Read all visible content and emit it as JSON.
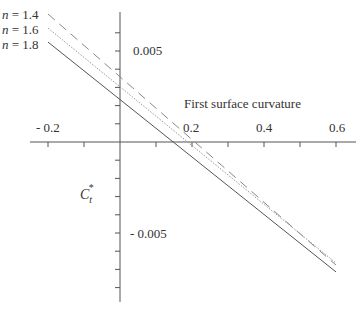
{
  "chart_data": {
    "type": "line",
    "title": "",
    "xlabel": "First surface curvature",
    "ylabel": "C_t*",
    "xlim": [
      -0.2,
      0.6
    ],
    "ylim": [
      -0.0088,
      0.0071
    ],
    "x_ticks": [
      -0.2,
      -0.1,
      0.1,
      0.2,
      0.3,
      0.4,
      0.5,
      0.6
    ],
    "x_tick_labels": [
      "- 0.2",
      "0.2",
      "0.4",
      "0.6"
    ],
    "y_tick_step": 0.001,
    "y_tick_labels": [
      "0.005",
      "- 0.005"
    ],
    "grid": false,
    "legend_position": "inline-left",
    "x": [
      -0.2,
      0.6
    ],
    "series": [
      {
        "name": "n = 1.4",
        "style": "dashed",
        "values": [
          0.00703,
          -0.00676
        ]
      },
      {
        "name": "n = 1.6",
        "style": "dotted",
        "values": [
          0.00626,
          -0.00665
        ]
      },
      {
        "name": "n = 1.8",
        "style": "solid",
        "values": [
          0.00549,
          -0.00714
        ]
      }
    ]
  },
  "labels": {
    "series": [
      {
        "n": "n",
        "rest": " = 1.4"
      },
      {
        "n": "n",
        "rest": " = 1.6"
      },
      {
        "n": "n",
        "rest": " = 1.8"
      }
    ],
    "y_pos": "0.005",
    "y_neg": "- 0.005",
    "x_neg": "- 0.2",
    "x_02": "0.2",
    "x_04": "0.4",
    "x_06": "0.6",
    "xlabel": "First surface curvature",
    "ylabel_main": "C",
    "ylabel_sub": "t",
    "ylabel_sup": "*"
  }
}
